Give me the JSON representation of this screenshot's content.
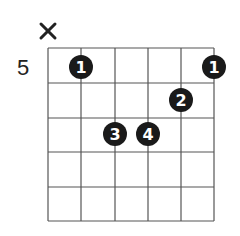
{
  "diagram": {
    "type": "guitar-chord-diagram",
    "start_fret_label": "5",
    "strings": 6,
    "frets_shown": 5,
    "muted_strings": [
      1
    ],
    "open_strings": [],
    "fingerings": [
      {
        "string": 2,
        "fret": 1,
        "finger": "1"
      },
      {
        "string": 6,
        "fret": 1,
        "finger": "1"
      },
      {
        "string": 5,
        "fret": 2,
        "finger": "2"
      },
      {
        "string": 3,
        "fret": 3,
        "finger": "3"
      },
      {
        "string": 4,
        "fret": 3,
        "finger": "4"
      }
    ],
    "mute_symbol": "×",
    "colors": {
      "grid": "#555555",
      "dot": "#1a1a1a",
      "dot_text": "#ffffff",
      "text": "#222222"
    }
  }
}
